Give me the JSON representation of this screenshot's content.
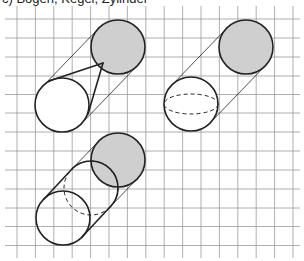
{
  "caption": "c) Bogen, Kegel, Zylinder",
  "colors": {
    "grid": "#9a9a9a",
    "stroke": "#222222",
    "gray_fill": "#cfcfcf",
    "white_fill": "#ffffff"
  },
  "grid": {
    "x_lines": [
      17,
      35.4,
      53.8,
      72.2,
      90.6,
      109,
      127.4,
      145.8,
      164.2,
      182.6,
      201,
      219.4,
      237.8,
      256.2,
      274.6,
      293
    ],
    "y_lines": [
      19,
      38,
      57,
      76,
      94.5,
      113,
      132,
      151,
      170,
      189,
      208,
      226.5,
      245.5
    ],
    "x_extent": [
      5,
      300
    ],
    "y_extent": [
      6,
      258
    ]
  },
  "figures": [
    {
      "name": "cone-in-cylinder",
      "back_circle": {
        "cx": 118,
        "cy": 47,
        "r": 27
      },
      "front_circle": {
        "cx": 62,
        "cy": 105,
        "r": 27
      },
      "cylinder_lines": [
        [
          43,
          86,
          99,
          28
        ],
        [
          81,
          124,
          137,
          66
        ]
      ],
      "cone_apex": [
        103,
        63
      ],
      "cone_lines": [
        [
          49,
          81,
          103,
          63
        ],
        [
          88,
          114,
          103,
          63
        ]
      ]
    },
    {
      "name": "sphere-in-cylinder",
      "back_circle": {
        "cx": 246,
        "cy": 47,
        "r": 27
      },
      "front_circle": {
        "cx": 191,
        "cy": 104,
        "r": 27
      },
      "cylinder_lines": [
        [
          172,
          85,
          227,
          28
        ],
        [
          210,
          123,
          265,
          66
        ]
      ],
      "dashed_ellipse": {
        "cx": 191,
        "cy": 104,
        "rx": 27,
        "ry": 10
      }
    },
    {
      "name": "cylinder-section",
      "back_circle": {
        "cx": 118,
        "cy": 160,
        "r": 27
      },
      "middle_circle": {
        "cx": 91,
        "cy": 188,
        "r": 27
      },
      "front_circle": {
        "cx": 63,
        "cy": 218,
        "r": 27
      },
      "thick_lines": [
        [
          44,
          199,
          72,
          169
        ],
        [
          82,
          237,
          110,
          207
        ]
      ],
      "thin_lines": [
        [
          72,
          169,
          99,
          141
        ],
        [
          110,
          207,
          137,
          179
        ]
      ]
    }
  ]
}
